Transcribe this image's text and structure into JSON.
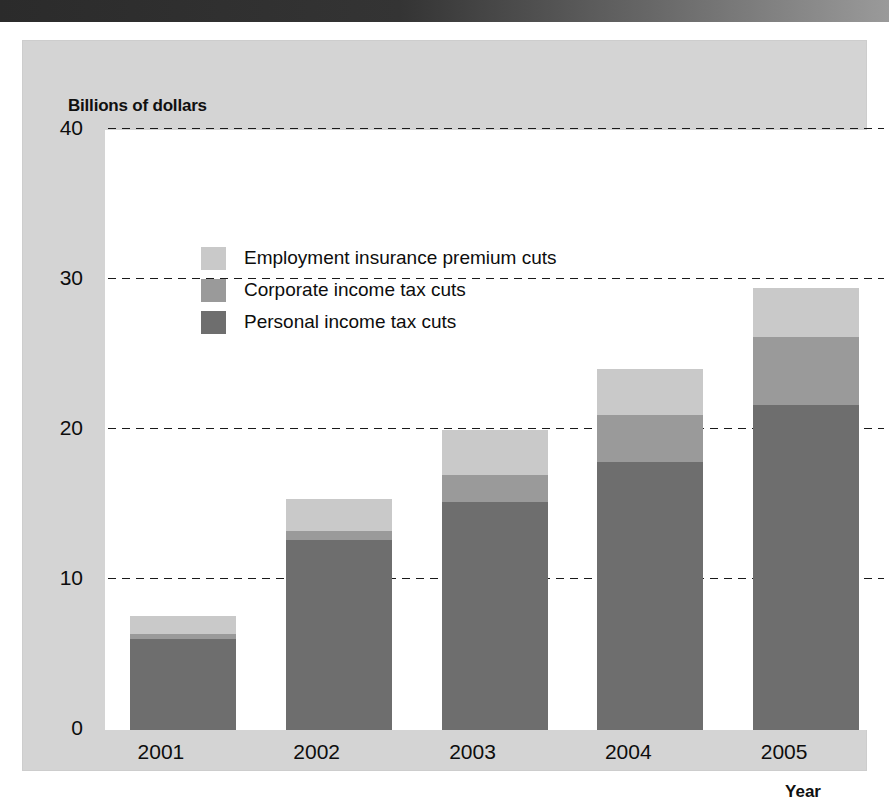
{
  "figure": {
    "y_axis_title": "Billions of dollars",
    "x_axis_title": "Year"
  },
  "colors": {
    "personal": "#6e6e6e",
    "corporate": "#9a9a9a",
    "employment_insurance": "#c9c9c9",
    "panel_background": "#d4d4d4",
    "plot_background": "#ffffff",
    "gridline": "#1a1a1a",
    "banner": "#2b2b2b"
  },
  "legend": {
    "position": "top-left inside plot",
    "items": [
      {
        "label": "Employment insurance premium cuts",
        "color": "#c9c9c9",
        "key": "employment_insurance"
      },
      {
        "label": "Corporate income tax cuts",
        "color": "#9a9a9a",
        "key": "corporate"
      },
      {
        "label": "Personal income tax cuts",
        "color": "#6e6e6e",
        "key": "personal"
      }
    ]
  },
  "y_axis": {
    "ticks": [
      "0",
      "10",
      "20",
      "30",
      "40"
    ],
    "tick_values": [
      0,
      10,
      20,
      30,
      40
    ],
    "min": 0,
    "max": 40
  },
  "chart_data": {
    "type": "bar",
    "stacked": true,
    "title": "",
    "subtitle": "",
    "xlabel": "Year",
    "ylabel": "Billions of dollars",
    "ylim": [
      0,
      40
    ],
    "yticks": [
      0,
      10,
      20,
      30,
      40
    ],
    "grid": "horizontal-dotted",
    "legend_position": "upper-left",
    "categories": [
      "2001",
      "2002",
      "2003",
      "2004",
      "2005"
    ],
    "series": [
      {
        "name": "Personal income tax cuts",
        "color": "#6e6e6e",
        "values": [
          6.1,
          12.7,
          15.2,
          17.9,
          21.7
        ]
      },
      {
        "name": "Corporate income tax cuts",
        "color": "#9a9a9a",
        "values": [
          0.3,
          0.6,
          1.8,
          3.1,
          4.5
        ]
      },
      {
        "name": "Employment insurance premium cuts",
        "color": "#c9c9c9",
        "values": [
          1.2,
          2.1,
          3.0,
          3.1,
          3.3
        ]
      }
    ],
    "totals": [
      7.6,
      15.4,
      20.0,
      24.1,
      29.5
    ]
  }
}
